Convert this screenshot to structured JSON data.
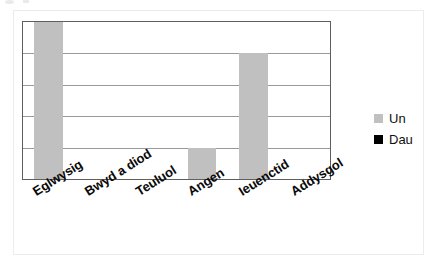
{
  "chart_data": {
    "type": "bar",
    "title": "",
    "subtitle": "",
    "xlabel": "",
    "ylabel": "",
    "categories": [
      "Eglwysig",
      "Bwyd a diod",
      "Teuluol",
      "Angen",
      "Ieuenctid",
      "Addysgol"
    ],
    "series": [
      {
        "name": "Un",
        "color": "#c0c0c0",
        "values": [
          5,
          0,
          0,
          1,
          4,
          0
        ]
      },
      {
        "name": "Dau",
        "color": "#000000",
        "values": [
          0,
          0,
          0,
          0,
          0,
          0
        ]
      }
    ],
    "ylim": [
      0,
      5
    ],
    "yticks": [
      0,
      1,
      2,
      3,
      4,
      5
    ],
    "ytick_labels": [
      "",
      "",
      "",
      "",
      "",
      ""
    ],
    "grid": true,
    "grid_axis": "y",
    "legend_position": "right",
    "x_tick_label_rotation": -32
  },
  "legend": {
    "items": [
      {
        "label": "Un",
        "color": "#c0c0c0"
      },
      {
        "label": "Dau",
        "color": "#000000"
      }
    ]
  },
  "axis": {
    "categories": [
      "Eglwysig",
      "Bwyd a diod",
      "Teuluol",
      "Angen",
      "Ieuenctid",
      "Addysgol"
    ]
  },
  "colors": {
    "series_un": "#c0c0c0",
    "series_dau": "#000000",
    "plot_border": "#5e5e5e",
    "gridline": "#9a9a9a",
    "figure_frame": "#ececec",
    "background": "#ffffff"
  }
}
